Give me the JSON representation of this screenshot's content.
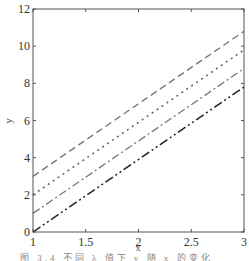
{
  "chart_data": {
    "type": "line",
    "title": "",
    "xlabel": "x",
    "ylabel": "y",
    "xlim": [
      1,
      3
    ],
    "ylim": [
      0,
      12
    ],
    "x_ticks": [
      "1",
      "1.5",
      "2",
      "2.5",
      "3"
    ],
    "y_ticks": [
      "0",
      "2",
      "4",
      "6",
      "8",
      "10",
      "12"
    ],
    "grid": false,
    "legend": null,
    "x": [
      1,
      3
    ],
    "series": [
      {
        "name": "dash-dot-dot line",
        "style": "dash-dot-dot",
        "values": [
          0,
          7.8
        ]
      },
      {
        "name": "dash-dot line",
        "style": "dash-dot",
        "values": [
          1,
          8.8
        ]
      },
      {
        "name": "dotted line",
        "style": "dotted",
        "values": [
          2,
          9.8
        ]
      },
      {
        "name": "dashed line",
        "style": "dashed",
        "values": [
          3,
          10.8
        ]
      }
    ]
  },
  "caption": "图 3.4  不同 λ 值下 y 随 x 的变化"
}
